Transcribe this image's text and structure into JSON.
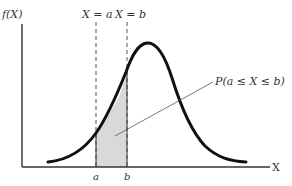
{
  "diagram": {
    "type": "normal-density-curve",
    "y_axis_label": "f(X)",
    "x_axis_label": "X",
    "vertical_line_a_label": "X = a",
    "vertical_line_b_label": "X = b",
    "tick_a_label": "a",
    "tick_b_label": "b",
    "shaded_region_label": "P(a ≤ X ≤ b)",
    "colors": {
      "curve": "#111111",
      "axes": "#333333",
      "shading": "#d9d9d9",
      "dashed_lines": "#555555"
    }
  }
}
